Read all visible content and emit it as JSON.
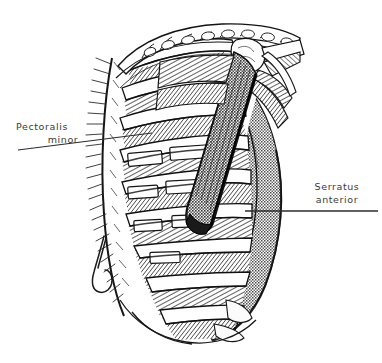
{
  "figure": {
    "type": "anatomical-line-illustration",
    "background_color": "#ffffff",
    "ink_color": "#1a1a1a",
    "label_color": "#3a3a3a",
    "shading": {
      "serratus_fill": "#8a8a8a",
      "pectoralis_minor_fill": "#767676",
      "bone_fill": "#ffffff",
      "muscle_hatch": "#2b2b2b"
    }
  },
  "labels": [
    {
      "id": "pectoralis-minor",
      "line1": "Pectoralis",
      "line2": "minor",
      "side": "left",
      "leader": {
        "x1": 18,
        "y1": 150,
        "x2": 152,
        "y2": 133
      }
    },
    {
      "id": "serratus-anterior",
      "line1": "Serratus",
      "line2": "anterior",
      "side": "right",
      "leader": {
        "x1": 378,
        "y1": 211,
        "x2": 245,
        "y2": 211
      }
    }
  ],
  "structures": [
    {
      "name": "clavicle",
      "rendering": "scalloped outlined bone, upper region"
    },
    {
      "name": "ribs",
      "rendering": "white banded bones, stacked vertically",
      "count": 9
    },
    {
      "name": "intercostal-muscles",
      "rendering": "dense diagonal hatching between ribs"
    },
    {
      "name": "pectoralis-minor",
      "rendering": "cut dark diagonal muscle band"
    },
    {
      "name": "serratus-anterior",
      "rendering": "stippled gray digitations, right side"
    },
    {
      "name": "vertebral-border",
      "rendering": "feathered hatch along left edge"
    },
    {
      "name": "retractor-hook",
      "rendering": "thin hooked instrument, lower left"
    },
    {
      "name": "costal-cartilage",
      "rendering": "pale bands at rib ends, lower right"
    }
  ]
}
